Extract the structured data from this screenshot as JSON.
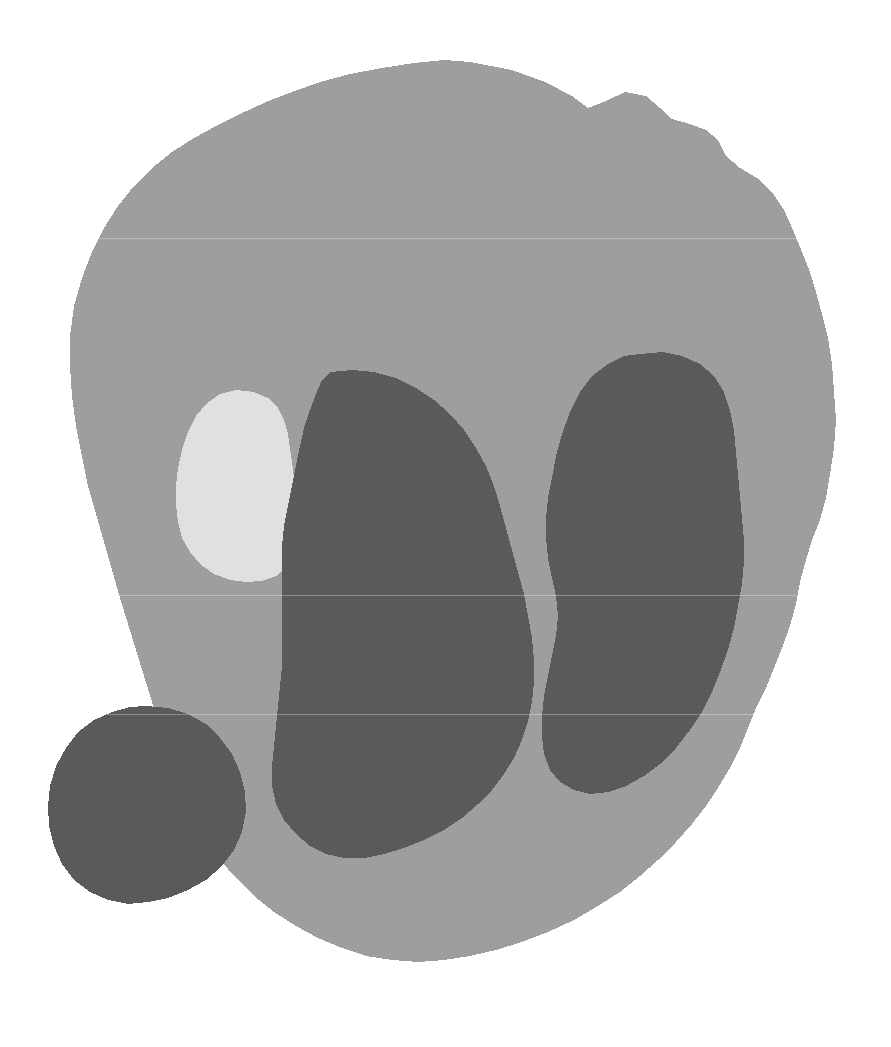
{
  "image": {
    "kind": "segmentation-mask",
    "width": 891,
    "height": 1047,
    "background_color": "#ffffff",
    "alt_text": "Grayscale segmentation mask with one large mid-gray region containing three dark-gray lesions and one bright region"
  },
  "palette": {
    "background": "#ffffff",
    "base_region": "#9e9e9e",
    "dark_region": "#5a5a5a",
    "bright_region": "#e0e0e0"
  },
  "regions": [
    {
      "id": "base",
      "label": "base-region",
      "fill": "#9e9e9e",
      "gray_level": 158,
      "bbox": [
        68,
        60,
        836,
        1000
      ],
      "path": "M 470 62 L 512 70 L 545 82 L 572 96 L 588 108 L 606 101 L 625 92 L 646 96 L 660 108 L 672 119 L 690 124 L 706 130 L 718 140 L 726 156 L 740 168 L 757 178 L 772 192 L 784 210 L 793 230 L 802 252 L 810 272 L 816 292 L 822 314 L 828 338 L 832 364 L 834 392 L 836 420 L 834 448 L 830 474 L 826 498 L 820 520 L 812 540 L 806 560 L 800 582 L 796 604 L 790 626 L 782 648 L 774 668 L 766 688 L 756 708 L 748 728 L 740 748 L 730 768 L 718 788 L 706 806 L 692 824 L 676 842 L 658 860 L 640 876 L 620 892 L 598 906 L 574 920 L 548 932 L 522 942 L 496 950 L 470 956 L 444 960 L 418 962 L 392 960 L 366 956 L 342 948 L 318 938 L 296 926 L 274 912 L 254 896 L 236 878 L 220 860 L 206 840 L 194 820 L 184 798 L 176 776 L 168 752 L 160 728 L 152 702 L 144 676 L 136 650 L 128 624 L 120 598 L 112 570 L 104 542 L 96 514 L 88 486 L 82 456 L 76 426 L 72 396 L 70 366 L 70 336 L 74 306 L 82 278 L 92 252 L 104 228 L 118 206 L 134 186 L 152 168 L 172 152 L 194 138 L 216 126 L 240 114 L 266 102 L 292 92 L 320 82 L 350 74 L 382 68 L 414 63 L 444 60 Z"
    },
    {
      "id": "lesion-left",
      "label": "dark-region-left",
      "fill": "#5a5a5a",
      "gray_level": 90,
      "bbox": [
        270,
        368,
        540,
        862
      ],
      "path": "M 330 372 L 352 370 L 374 372 L 396 378 L 416 388 L 434 400 L 450 414 L 464 430 L 476 448 L 486 466 L 494 486 L 500 506 L 506 528 L 512 550 L 518 572 L 524 594 L 528 616 L 532 638 L 534 660 L 534 682 L 532 702 L 528 722 L 522 740 L 514 758 L 504 774 L 492 790 L 478 804 L 462 818 L 444 830 L 424 840 L 404 848 L 384 854 L 364 858 L 344 858 L 326 854 L 310 846 L 296 834 L 284 820 L 276 804 L 272 786 L 272 766 L 274 746 L 276 726 L 278 706 L 280 686 L 282 666 L 282 646 L 282 626 L 282 606 L 282 586 L 282 566 L 282 546 L 284 526 L 288 506 L 292 486 L 296 466 L 300 446 L 304 428 L 310 410 L 316 394 L 322 380 Z"
    },
    {
      "id": "lesion-right",
      "label": "dark-region-right",
      "fill": "#5a5a5a",
      "gray_level": 90,
      "bbox": [
        540,
        352,
        746,
        840
      ],
      "path": "M 640 354 L 662 352 L 682 356 L 700 364 L 714 376 L 724 392 L 730 410 L 734 430 L 736 452 L 738 474 L 740 496 L 742 518 L 744 540 L 744 562 L 742 584 L 738 606 L 734 628 L 728 650 L 720 672 L 712 692 L 702 712 L 690 730 L 676 748 L 660 764 L 644 776 L 626 786 L 608 792 L 590 794 L 574 790 L 560 782 L 550 770 L 544 754 L 542 736 L 542 716 L 544 696 L 548 676 L 552 656 L 556 636 L 558 616 L 556 596 L 552 578 L 548 558 L 546 538 L 546 518 L 548 498 L 552 478 L 556 456 L 562 434 L 570 412 L 580 392 L 592 376 L 608 364 L 624 356 Z"
    },
    {
      "id": "lesion-bottom-left",
      "label": "dark-region-bottom-left",
      "fill": "#5a5a5a",
      "gray_level": 90,
      "bbox": [
        48,
        704,
        246,
        906
      ],
      "path": "M 146 706 L 168 708 L 188 714 L 206 724 L 220 738 L 232 754 L 240 772 L 245 792 L 246 812 L 242 832 L 234 850 L 222 866 L 206 880 L 188 890 L 168 898 L 148 902 L 128 904 L 108 900 L 90 892 L 74 880 L 62 864 L 54 846 L 49 826 L 48 806 L 50 786 L 56 766 L 66 748 L 78 732 L 94 720 L 112 712 L 130 707 Z"
    },
    {
      "id": "bright-nodule",
      "label": "bright-region",
      "fill": "#e0e0e0",
      "gray_level": 224,
      "bbox": [
        176,
        388,
        300,
        582
      ],
      "path": "M 236 390 L 254 392 L 268 398 L 278 408 L 284 420 L 288 434 L 290 448 L 292 462 L 294 478 L 296 494 L 298 510 L 298 526 L 296 542 L 292 556 L 286 568 L 276 576 L 262 581 L 246 582 L 230 580 L 214 574 L 200 564 L 190 552 L 182 538 L 178 522 L 176 504 L 176 486 L 178 468 L 182 450 L 188 432 L 196 416 L 206 404 L 220 394 Z"
    }
  ],
  "scanlines": [
    {
      "y": 238,
      "color": "#ffffff"
    },
    {
      "y": 595,
      "color": "#ffffff"
    },
    {
      "y": 714,
      "color": "#ffffff"
    }
  ]
}
